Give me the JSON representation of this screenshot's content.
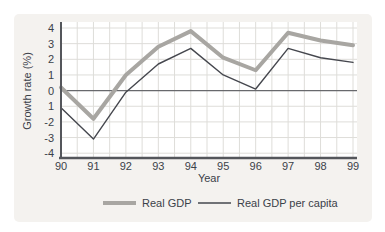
{
  "chart_data": {
    "type": "line",
    "title": "",
    "xlabel": "Year",
    "ylabel": "Growth rate (%)",
    "categories": [
      "90",
      "91",
      "92",
      "93",
      "94",
      "95",
      "96",
      "97",
      "98",
      "99"
    ],
    "y_tick_labels": [
      "4",
      "3",
      "2",
      "1",
      "0",
      "1",
      "-2",
      "-3",
      "-4"
    ],
    "y_tick_values": [
      4,
      3,
      2,
      1,
      0,
      -1,
      -2,
      -3,
      -4
    ],
    "ylim": [
      -4,
      4
    ],
    "grid": true,
    "grid_x_interval_years": 0.5,
    "legend_position": "bottom",
    "series": [
      {
        "name": "Real GDP",
        "color": "#a8a6a2",
        "width": 4,
        "values": [
          0.2,
          -1.8,
          1.0,
          2.8,
          3.8,
          2.1,
          1.3,
          3.7,
          3.2,
          2.9
        ]
      },
      {
        "name": "Real GDP per capita",
        "color": "#45474e",
        "width": 1.4,
        "values": [
          -1.1,
          -3.1,
          -0.1,
          1.7,
          2.7,
          1.0,
          0.1,
          2.7,
          2.1,
          1.8
        ]
      }
    ],
    "colors": {
      "panel_bg": "#f4f2ef",
      "plot_bg": "#ffffff",
      "gridline": "#deddd9",
      "axis": "#54565b",
      "zero_line": "#68696d",
      "text": "#3b4149"
    }
  }
}
